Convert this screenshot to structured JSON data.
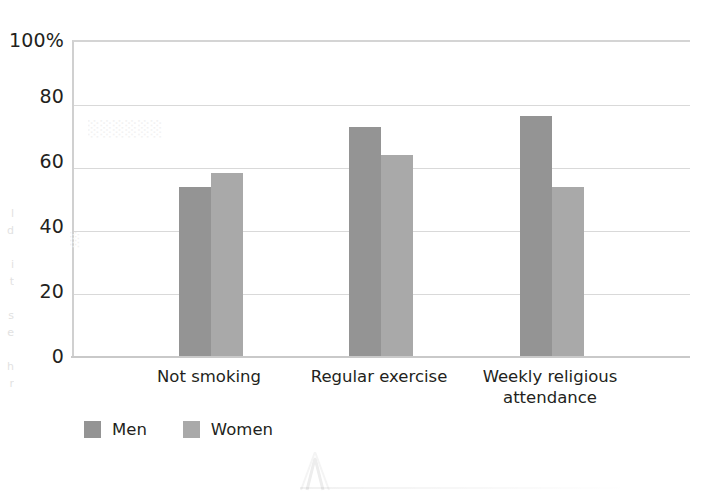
{
  "chart_data": {
    "type": "bar",
    "title": "",
    "subtitle": "",
    "xlabel": "",
    "ylabel": "",
    "categories": [
      "Not smoking",
      "Regular exercise",
      "Weekly religious attendance"
    ],
    "series": [
      {
        "name": "Men",
        "color": "#949494",
        "values": [
          54,
          73,
          76.5
        ]
      },
      {
        "name": "Women",
        "color": "#a9a9a9",
        "values": [
          58.5,
          64,
          54
        ]
      }
    ],
    "ylim": [
      0,
      100
    ],
    "ytick_labels": [
      "100%",
      "80",
      "60",
      "40",
      "20",
      "0"
    ],
    "ytick_values": [
      100,
      80,
      60,
      40,
      20,
      0
    ],
    "grid": "horizontal",
    "legend_position": "bottom-left",
    "value_unit": "percent"
  },
  "axis": {
    "y_ticks": [
      {
        "label": "100%",
        "value": 100
      },
      {
        "label": "80",
        "value": 80
      },
      {
        "label": "60",
        "value": 60
      },
      {
        "label": "40",
        "value": 40
      },
      {
        "label": "20",
        "value": 20
      },
      {
        "label": "0",
        "value": 0
      }
    ]
  },
  "categories": [
    {
      "line1": "Not smoking",
      "line2": ""
    },
    {
      "line1": "Regular exercise",
      "line2": ""
    },
    {
      "line1": "Weekly religious",
      "line2": "attendance"
    }
  ],
  "legend": {
    "items": [
      {
        "label": "Men",
        "color": "#949494"
      },
      {
        "label": "Women",
        "color": "#a9a9a9"
      }
    ]
  },
  "artifacts": {
    "left_margin_bleed": "l\nd\n\ni\nt\n\ns\ne\n\nh\nr",
    "plot_bleed_top": "",
    "plot_bleed_mid": "",
    "note": "faint scanner bleed-through from facing page; illegible"
  }
}
